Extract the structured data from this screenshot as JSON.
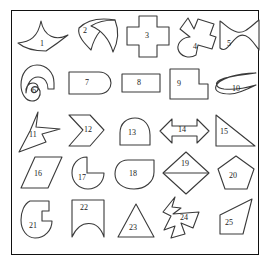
{
  "figure": {
    "frame_color": "#111111",
    "background_color": "#ffffff",
    "outline_color": "#3a3a3a",
    "label_color": "#1a1a1a",
    "rows": 5,
    "columns": 5,
    "shape_count": 25
  },
  "shapes": [
    {
      "id": 1,
      "label": "1",
      "name": "concave-four-point-star-curved",
      "row": 1,
      "col": 1
    },
    {
      "id": 2,
      "label": "2",
      "name": "crossed-loop-bowtie-curve",
      "row": 1,
      "col": 2
    },
    {
      "id": 3,
      "label": "3",
      "name": "plus-cross",
      "row": 1,
      "col": 3
    },
    {
      "id": 4,
      "label": "4",
      "name": "hooked-arrow-blob",
      "row": 1,
      "col": 4
    },
    {
      "id": 5,
      "label": "5",
      "name": "s-wave-ribbon",
      "row": 1,
      "col": 5
    },
    {
      "id": 6,
      "label": "6",
      "name": "spiral-hook",
      "row": 2,
      "col": 1
    },
    {
      "id": 7,
      "label": "7",
      "name": "rounded-end-rectangle",
      "row": 2,
      "col": 2
    },
    {
      "id": 8,
      "label": "8",
      "name": "rectangle",
      "row": 2,
      "col": 3
    },
    {
      "id": 9,
      "label": "9",
      "name": "l-shape-polygon",
      "row": 2,
      "col": 4
    },
    {
      "id": 10,
      "label": "10",
      "name": "crescent-sliver-curve",
      "row": 2,
      "col": 5
    },
    {
      "id": 11,
      "label": "11",
      "name": "concave-arrow-star",
      "row": 3,
      "col": 1
    },
    {
      "id": 12,
      "label": "12",
      "name": "double-chevron",
      "row": 3,
      "col": 2
    },
    {
      "id": 13,
      "label": "13",
      "name": "dome-semicircle",
      "row": 3,
      "col": 3
    },
    {
      "id": 14,
      "label": "14",
      "name": "double-headed-arrow",
      "row": 3,
      "col": 4
    },
    {
      "id": 15,
      "label": "15",
      "name": "right-triangle",
      "row": 3,
      "col": 5
    },
    {
      "id": 16,
      "label": "16",
      "name": "parallelogram",
      "row": 4,
      "col": 1
    },
    {
      "id": 17,
      "label": "17",
      "name": "pac-man-notched-circle",
      "row": 4,
      "col": 2
    },
    {
      "id": 18,
      "label": "18",
      "name": "teardrop-oval",
      "row": 4,
      "col": 3
    },
    {
      "id": 19,
      "label": "19",
      "name": "diamond-with-chord",
      "row": 4,
      "col": 4
    },
    {
      "id": 20,
      "label": "20",
      "name": "pentagon",
      "row": 4,
      "col": 5
    },
    {
      "id": 21,
      "label": "21",
      "name": "notched-oval",
      "row": 5,
      "col": 1
    },
    {
      "id": 22,
      "label": "22",
      "name": "banner-concave-bottom",
      "row": 5,
      "col": 2
    },
    {
      "id": 23,
      "label": "23",
      "name": "triangle",
      "row": 5,
      "col": 3
    },
    {
      "id": 24,
      "label": "24",
      "name": "jagged-arrow-star",
      "row": 5,
      "col": 4
    },
    {
      "id": 25,
      "label": "25",
      "name": "irregular-quadrilateral",
      "row": 5,
      "col": 5
    }
  ]
}
